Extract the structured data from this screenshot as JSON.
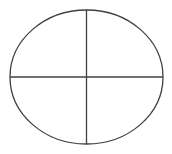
{
  "diagram": {
    "type": "ellipse-quadrants",
    "canvas": {
      "width": 172,
      "height": 154,
      "background": "#ffffff"
    },
    "stroke_color": "#404040",
    "stroke_width": 1.3,
    "ellipse": {
      "cx": 86.5,
      "cy": 77,
      "rx": 76.5,
      "ry": 67
    },
    "vertical_line": {
      "x": 86.5,
      "y1": 10,
      "y2": 144
    },
    "horizontal_line": {
      "y": 77,
      "x1": 10,
      "x2": 163
    },
    "quadrants": [
      "top-left",
      "top-right",
      "bottom-left",
      "bottom-right"
    ]
  }
}
